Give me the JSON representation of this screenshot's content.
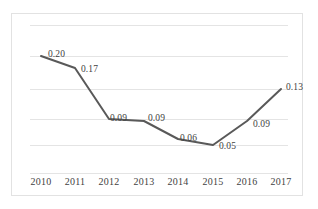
{
  "chart_data": {
    "type": "line",
    "title": "",
    "subtitle": "",
    "xlabel": "",
    "ylabel": "",
    "categories": [
      "2010",
      "2011",
      "2012",
      "2013",
      "2014",
      "2015",
      "2016",
      "2017"
    ],
    "values": [
      0.2,
      0.17,
      0.09,
      0.09,
      0.06,
      0.05,
      0.09,
      0.13
    ],
    "point_labels": [
      "0.20",
      "0.17",
      "0.09",
      "0.09",
      "0.06",
      "0.05",
      "0.09",
      "0.13"
    ],
    "series": [
      {
        "name": "",
        "values": [
          0.2,
          0.17,
          0.09,
          0.09,
          0.06,
          0.05,
          0.09,
          0.13
        ]
      }
    ],
    "ylim": [
      0.0,
      0.25
    ],
    "grid": true,
    "grid_axis": "y",
    "gridline_count": 6,
    "legend": false,
    "legend_position": "none",
    "markers": false,
    "axis_tick_labels_visible": {
      "x": true,
      "y": false
    },
    "colors": {
      "line": "#595959",
      "gridline": "#e4e4e4",
      "border": "#e2e2e2",
      "label_text": "#3f3f3f",
      "background": "#ffffff"
    }
  },
  "geometry": {
    "gridlines_y": [
      11,
      42,
      75,
      105,
      131,
      159
    ],
    "points": [
      {
        "x": 29,
        "y": 42
      },
      {
        "x": 63,
        "y": 54
      },
      {
        "x": 97,
        "y": 105
      },
      {
        "x": 132,
        "y": 107
      },
      {
        "x": 166,
        "y": 125
      },
      {
        "x": 201,
        "y": 131
      },
      {
        "x": 235,
        "y": 107
      },
      {
        "x": 269,
        "y": 75
      }
    ],
    "label_positions": [
      {
        "x": 36,
        "y": 36
      },
      {
        "x": 69,
        "y": 51
      },
      {
        "x": 98,
        "y": 100
      },
      {
        "x": 136,
        "y": 100
      },
      {
        "x": 168,
        "y": 120
      },
      {
        "x": 207,
        "y": 128
      },
      {
        "x": 241,
        "y": 106
      },
      {
        "x": 274,
        "y": 69
      }
    ],
    "tick_positions": [
      29,
      63,
      97,
      132,
      166,
      201,
      235,
      269
    ]
  }
}
